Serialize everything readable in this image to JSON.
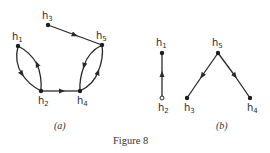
{
  "figure": {
    "caption": "Figure 8",
    "panels": [
      {
        "id": "a",
        "label": "(a)",
        "nodes": [
          {
            "id": "h1",
            "base": "h",
            "sub": "1"
          },
          {
            "id": "h2",
            "base": "h",
            "sub": "2"
          },
          {
            "id": "h3",
            "base": "h",
            "sub": "3"
          },
          {
            "id": "h4",
            "base": "h",
            "sub": "4"
          },
          {
            "id": "h5",
            "base": "h",
            "sub": "5"
          }
        ],
        "edges": [
          {
            "from": "h3",
            "to": "h5"
          },
          {
            "from": "h1",
            "to": "h2"
          },
          {
            "from": "h2",
            "to": "h1"
          },
          {
            "from": "h2",
            "to": "h4"
          },
          {
            "from": "h5",
            "to": "h4"
          },
          {
            "from": "h4",
            "to": "h5"
          }
        ]
      },
      {
        "id": "b",
        "label": "(b)",
        "nodes": [
          {
            "id": "h1",
            "base": "h",
            "sub": "1"
          },
          {
            "id": "h2",
            "base": "h",
            "sub": "2"
          },
          {
            "id": "h5",
            "base": "h",
            "sub": "5"
          },
          {
            "id": "h3",
            "base": "h",
            "sub": "3"
          },
          {
            "id": "h4",
            "base": "h",
            "sub": "4"
          }
        ],
        "edges": [
          {
            "from": "h2",
            "to": "h1"
          },
          {
            "from": "h5",
            "to": "h3"
          },
          {
            "from": "h5",
            "to": "h4"
          }
        ]
      }
    ],
    "colors": {
      "ink": "#2a2a2a",
      "background": "#ffffff"
    }
  }
}
